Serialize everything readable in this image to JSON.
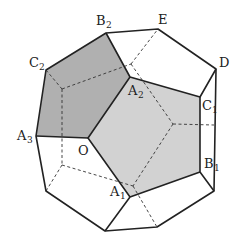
{
  "diagram": {
    "shade_dark": "#a9a9a9",
    "shade_light": "#cfcfcf",
    "line_color": "#222222",
    "labels": {
      "B2": {
        "main": "B",
        "sub": "2"
      },
      "E": {
        "main": "E",
        "sub": ""
      },
      "D": {
        "main": "D",
        "sub": ""
      },
      "C2": {
        "main": "C",
        "sub": "2"
      },
      "A2": {
        "main": "A",
        "sub": "2"
      },
      "C1": {
        "main": "C",
        "sub": "1"
      },
      "A3": {
        "main": "A",
        "sub": "3"
      },
      "O": {
        "main": "O",
        "sub": ""
      },
      "B1": {
        "main": "B",
        "sub": "1"
      },
      "A1": {
        "main": "A",
        "sub": "1"
      }
    }
  }
}
